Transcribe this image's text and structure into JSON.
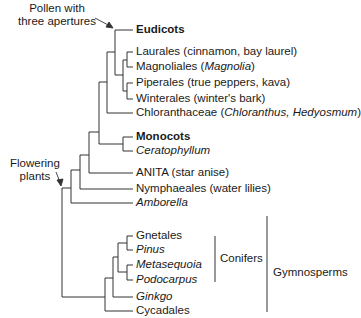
{
  "annotations": {
    "pollen": [
      "Pollen with",
      "three apertures"
    ],
    "flowering": [
      "Flowering",
      "plants"
    ]
  },
  "taxa": [
    {
      "id": "eudicots",
      "parts": [
        {
          "t": "Eudicots",
          "s": "b"
        }
      ]
    },
    {
      "id": "laurales",
      "parts": [
        {
          "t": "Laurales (cinnamon, bay laurel)",
          "s": ""
        }
      ]
    },
    {
      "id": "magnoliales",
      "parts": [
        {
          "t": "Magnoliales (",
          "s": ""
        },
        {
          "t": "Magnolia",
          "s": "i"
        },
        {
          "t": ")",
          "s": ""
        }
      ]
    },
    {
      "id": "piperales",
      "parts": [
        {
          "t": "Piperales (true peppers, kava)",
          "s": ""
        }
      ]
    },
    {
      "id": "winterales",
      "parts": [
        {
          "t": "Winterales (winter's bark)",
          "s": ""
        }
      ]
    },
    {
      "id": "chloranthaceae",
      "parts": [
        {
          "t": "Chloranthaceae (",
          "s": ""
        },
        {
          "t": "Chloranthus, Hedyosmum",
          "s": "i"
        },
        {
          "t": ")",
          "s": ""
        }
      ]
    },
    {
      "id": "monocots",
      "parts": [
        {
          "t": "Monocots",
          "s": "b"
        }
      ]
    },
    {
      "id": "ceratophyllum",
      "parts": [
        {
          "t": "Ceratophyllum",
          "s": "i"
        }
      ]
    },
    {
      "id": "anita",
      "parts": [
        {
          "t": "ANITA (star anise)",
          "s": ""
        }
      ]
    },
    {
      "id": "nymphaeales",
      "parts": [
        {
          "t": "Nymphaeales (water lilies)",
          "s": ""
        }
      ]
    },
    {
      "id": "amborella",
      "parts": [
        {
          "t": "Amborella",
          "s": "i"
        }
      ]
    },
    {
      "id": "gnetales",
      "parts": [
        {
          "t": "Gnetales",
          "s": ""
        }
      ]
    },
    {
      "id": "pinus",
      "parts": [
        {
          "t": "Pinus",
          "s": "i"
        }
      ]
    },
    {
      "id": "metasequoia",
      "parts": [
        {
          "t": "Metasequoia",
          "s": "i"
        }
      ]
    },
    {
      "id": "podocarpus",
      "parts": [
        {
          "t": "Podocarpus",
          "s": "i"
        }
      ]
    },
    {
      "id": "ginkgo",
      "parts": [
        {
          "t": "Ginkgo",
          "s": "i"
        }
      ]
    },
    {
      "id": "cycadales",
      "parts": [
        {
          "t": "Cycadales",
          "s": ""
        }
      ]
    }
  ],
  "groups": {
    "conifers": "Conifers",
    "gymnosperms": "Gymnosperms"
  }
}
